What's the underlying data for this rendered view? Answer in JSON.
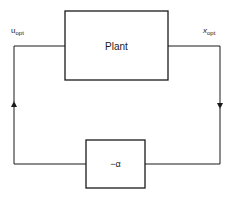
{
  "diagram": {
    "type": "feedback-loop",
    "blocks": {
      "plant": {
        "label": "Plant"
      },
      "gain": {
        "label": "−α"
      }
    },
    "signals": {
      "input": {
        "symbol": "u",
        "subscript": "opt"
      },
      "output": {
        "symbol": "x",
        "subscript": "opt"
      }
    },
    "colors": {
      "stroke": "#1a1a1a",
      "background": "#ffffff"
    }
  }
}
